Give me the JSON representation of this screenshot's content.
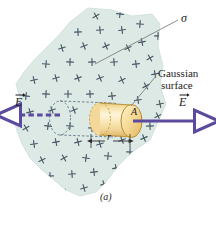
{
  "figure": {
    "caption": "(a)",
    "colors": {
      "sheet_fill": "#dce9e5",
      "sheet_edge": "#c6d9d4",
      "charge_mark": "#4a5a66",
      "cylinder_light": "#fdf3d2",
      "cylinder_mid": "#f6dd9c",
      "cylinder_dark": "#e0b865",
      "cylinder_edge": "#b78a2e",
      "field_arrow": "#5b4a9e",
      "leader_line": "#6e6e6e",
      "dash_outline": "#6b7f8c",
      "text": "#1b1b1b"
    },
    "labels": {
      "sigma": "σ",
      "gaussian_line1": "Gaussian",
      "gaussian_line2": "surface",
      "field_left": "E",
      "field_right": "E",
      "area": "A",
      "radius": "r"
    },
    "icons": {
      "charge": "plus-sign-icon",
      "field_left": "field-arrow-left-icon",
      "field_right": "field-arrow-right-icon",
      "dimension": "dimension-arrow-icon"
    },
    "charge_marks": [
      [
        96,
        16
      ],
      [
        120,
        14
      ],
      [
        140,
        24
      ],
      [
        158,
        36
      ],
      [
        78,
        32
      ],
      [
        100,
        30
      ],
      [
        122,
        30
      ],
      [
        142,
        42
      ],
      [
        163,
        48
      ],
      [
        62,
        48
      ],
      [
        84,
        46
      ],
      [
        106,
        46
      ],
      [
        128,
        48
      ],
      [
        150,
        58
      ],
      [
        168,
        62
      ],
      [
        46,
        64
      ],
      [
        70,
        62
      ],
      [
        92,
        62
      ],
      [
        114,
        62
      ],
      [
        136,
        64
      ],
      [
        155,
        74
      ],
      [
        34,
        80
      ],
      [
        56,
        78
      ],
      [
        78,
        78
      ],
      [
        100,
        78
      ],
      [
        122,
        80
      ],
      [
        146,
        86
      ],
      [
        166,
        90
      ],
      [
        26,
        96
      ],
      [
        46,
        94
      ],
      [
        68,
        94
      ],
      [
        90,
        94
      ],
      [
        112,
        96
      ],
      [
        138,
        100
      ],
      [
        160,
        104
      ],
      [
        30,
        112
      ],
      [
        52,
        110
      ],
      [
        74,
        110
      ],
      [
        96,
        112
      ],
      [
        158,
        116
      ],
      [
        26,
        128
      ],
      [
        48,
        126
      ],
      [
        70,
        126
      ],
      [
        92,
        128
      ],
      [
        150,
        126
      ],
      [
        170,
        122
      ],
      [
        34,
        144
      ],
      [
        56,
        142
      ],
      [
        78,
        142
      ],
      [
        100,
        144
      ],
      [
        122,
        140
      ],
      [
        144,
        138
      ],
      [
        42,
        160
      ],
      [
        64,
        158
      ],
      [
        86,
        158
      ],
      [
        108,
        156
      ],
      [
        130,
        152
      ],
      [
        50,
        176
      ],
      [
        72,
        174
      ],
      [
        94,
        172
      ],
      [
        116,
        168
      ],
      [
        62,
        190
      ],
      [
        84,
        188
      ],
      [
        104,
        184
      ]
    ]
  }
}
